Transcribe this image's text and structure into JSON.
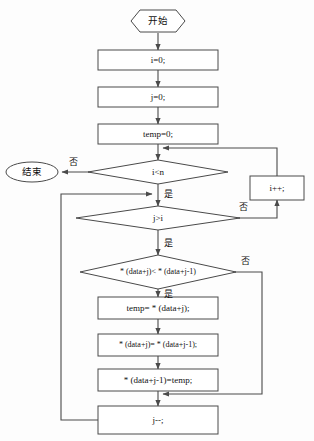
{
  "diagram": {
    "colors": {
      "stroke": "#4a4a4a",
      "text": "#111111",
      "background": "#fdfdfd",
      "node_fill": "#ffffff"
    },
    "nodes": {
      "start": {
        "label": "开始",
        "shape": "hexagon"
      },
      "init_i": {
        "label": "i=0;",
        "shape": "process"
      },
      "init_j": {
        "label": "j=0;",
        "shape": "process"
      },
      "init_temp": {
        "label": "temp=0;",
        "shape": "process"
      },
      "cond_i": {
        "label": "i<n",
        "shape": "decision"
      },
      "end": {
        "label": "结束",
        "shape": "terminator"
      },
      "incr_i": {
        "label": "i++;",
        "shape": "process"
      },
      "cond_j": {
        "label": "j>i",
        "shape": "decision"
      },
      "cond_cmp": {
        "label": "* (data+j)< * (data+j-1)",
        "shape": "decision"
      },
      "swap1": {
        "label": "temp= * (data+j);",
        "shape": "process"
      },
      "swap2": {
        "label": "* (data+j)= * (data+j-1);",
        "shape": "process"
      },
      "swap3": {
        "label": "* (data+j-1)=temp;",
        "shape": "process"
      },
      "decr_j": {
        "label": "j--;",
        "shape": "process"
      }
    },
    "edge_labels": {
      "cond_i_no": "否",
      "cond_i_yes": "是",
      "cond_j_no": "否",
      "cond_j_yes": "是",
      "cond_cmp_no": "否",
      "cond_cmp_yes": "是"
    }
  }
}
